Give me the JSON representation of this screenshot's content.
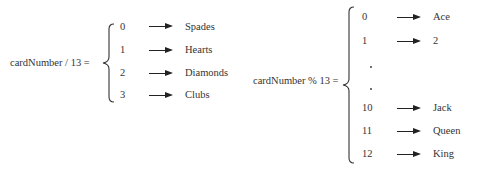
{
  "left": {
    "expression": "cardNumber / 13 =",
    "mappings": [
      {
        "value": "0",
        "label": "Spades"
      },
      {
        "value": "1",
        "label": "Hearts"
      },
      {
        "value": "2",
        "label": "Diamonds"
      },
      {
        "value": "3",
        "label": "Clubs"
      }
    ]
  },
  "right": {
    "expression": "cardNumber % 13 =",
    "mappings": [
      {
        "value": "0",
        "label": "Ace"
      },
      {
        "value": "1",
        "label": "2"
      },
      {
        "value": ".",
        "label": ""
      },
      {
        "value": ".",
        "label": ""
      },
      {
        "value": "10",
        "label": "Jack"
      },
      {
        "value": "11",
        "label": "Queen"
      },
      {
        "value": "12",
        "label": "King"
      }
    ]
  }
}
